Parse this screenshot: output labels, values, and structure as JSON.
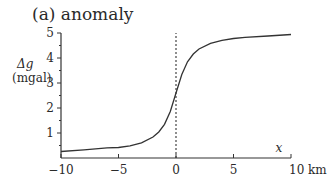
{
  "chart_data": {
    "type": "line",
    "title": "(a)  anomaly",
    "xlabel": "x",
    "xunit": "km",
    "ylabel": "Δg",
    "yunit": "(mgal)",
    "xlim": [
      -10,
      10
    ],
    "ylim": [
      0,
      5
    ],
    "xticks": [
      -10,
      -5,
      0,
      5,
      10
    ],
    "xtick_labels": [
      "−10",
      "−5",
      "0",
      "5",
      "10 km"
    ],
    "yticks": [
      1,
      2,
      3,
      4,
      5
    ],
    "ytick_labels": [
      "1",
      "2",
      "3",
      "4",
      "5"
    ],
    "grid": false,
    "legend": null,
    "annotations": [
      "dashed vertical line at x = 0"
    ],
    "series": [
      {
        "name": "anomaly",
        "x": [
          -10,
          -8,
          -6,
          -5,
          -4,
          -3,
          -2,
          -1.5,
          -1,
          -0.5,
          0,
          0.5,
          1,
          1.5,
          2,
          3,
          4,
          5,
          6,
          8,
          10
        ],
        "values": [
          0.26,
          0.33,
          0.41,
          0.42,
          0.49,
          0.61,
          0.84,
          1.04,
          1.35,
          1.86,
          2.6,
          3.34,
          3.85,
          4.16,
          4.36,
          4.59,
          4.71,
          4.78,
          4.83,
          4.88,
          4.94
        ]
      }
    ]
  }
}
